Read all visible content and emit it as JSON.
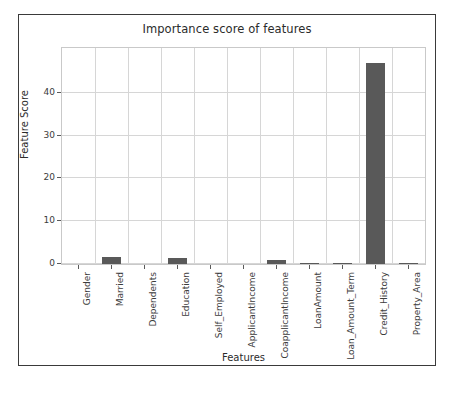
{
  "chart_data": {
    "type": "bar",
    "title": "Importance score of features",
    "xlabel": "Features",
    "ylabel": "Feature Score",
    "categories": [
      "Gender",
      "Married",
      "Dependents",
      "Education",
      "Self_Employed",
      "ApplicantIncome",
      "CoapplicantIncome",
      "LoanAmount",
      "Loan_Amount_Term",
      "Credit_History",
      "Property_Area"
    ],
    "values": [
      0.0,
      1.7,
      0.0,
      1.4,
      0.0,
      0.0,
      0.9,
      0.25,
      0.2,
      47.0,
      0.25
    ],
    "ylim": [
      0,
      50.5
    ],
    "yticks": [
      0,
      10,
      20,
      30,
      40
    ],
    "ytick_labels": [
      "0",
      "10",
      "20",
      "30",
      "40"
    ],
    "grid": true,
    "legend": "none",
    "bar_color": "#595959",
    "grid_color": "#d6d6d6",
    "axes_color": "#c9c9c9",
    "frame_color": "#3a3a3a",
    "background": "#ffffff"
  }
}
